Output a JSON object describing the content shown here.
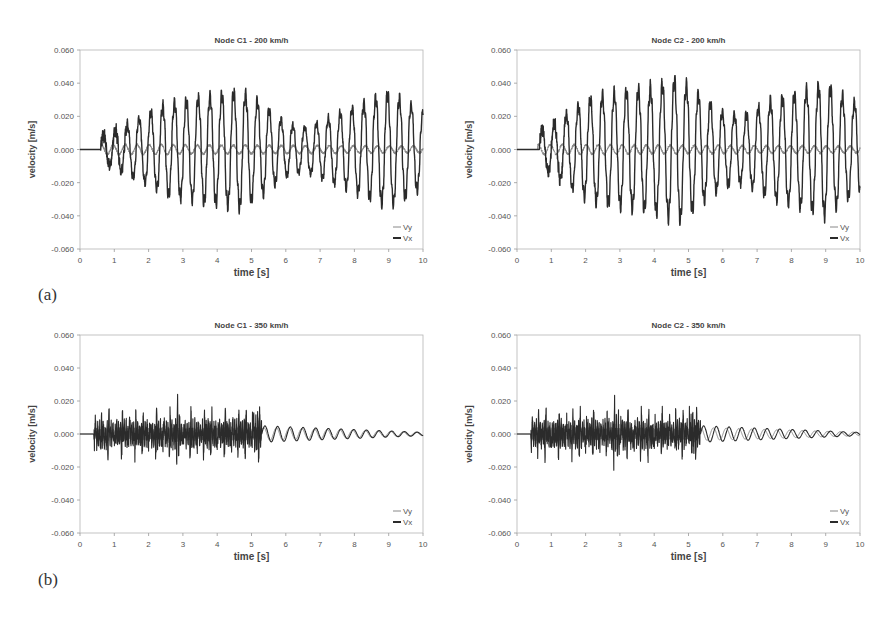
{
  "figure": {
    "panel_labels": [
      {
        "id": "a",
        "text": "(a)",
        "x": 38,
        "y": 285
      },
      {
        "id": "b",
        "text": "(b)",
        "x": 38,
        "y": 570
      }
    ]
  },
  "chart_data": [
    {
      "id": "c1-200",
      "type": "line",
      "title": "Node C1 - 200 km/h",
      "xlabel": "time [s]",
      "ylabel": "velocity [m/s]",
      "xlim": [
        0,
        10
      ],
      "ylim": [
        -0.06,
        0.06
      ],
      "xticks": [
        0,
        1,
        2,
        3,
        4,
        5,
        6,
        7,
        8,
        9,
        10
      ],
      "yticks": [
        "0.060",
        "0.040",
        "0.020",
        "0.000",
        "-0.020",
        "-0.040",
        "-0.060"
      ],
      "grid": false,
      "legend": {
        "position": "lower right",
        "entries": [
          "Vy",
          "Vx"
        ]
      },
      "plot_box": {
        "left": 80,
        "top": 50,
        "right": 423,
        "bottom": 249
      },
      "series": [
        {
          "name": "Vy",
          "color": "#888888",
          "width": 1.0,
          "description": "small oscillation about zero after ~0.6 s",
          "onset": 0.6,
          "period": 0.35,
          "amp_points": [
            [
              0.6,
              0.003
            ],
            [
              10,
              0.002
            ]
          ]
        },
        {
          "name": "Vx",
          "color": "#2b2b2b",
          "width": 1.4,
          "description": "large periodic oscillation, ~0.35 s period, envelope peaks near 4.7 s and 9.0 s",
          "onset": 0.6,
          "period": 0.345,
          "amp_points": [
            [
              0.6,
              0.008
            ],
            [
              1.0,
              0.011
            ],
            [
              1.7,
              0.018
            ],
            [
              2.5,
              0.027
            ],
            [
              3.5,
              0.031
            ],
            [
              4.7,
              0.035
            ],
            [
              5.3,
              0.027
            ],
            [
              6.0,
              0.016
            ],
            [
              6.5,
              0.013
            ],
            [
              7.3,
              0.019
            ],
            [
              8.3,
              0.028
            ],
            [
              9.0,
              0.034
            ],
            [
              9.7,
              0.026
            ],
            [
              10,
              0.022
            ]
          ],
          "peaks_pos_max": 0.034,
          "peaks_neg_min": -0.038
        }
      ]
    },
    {
      "id": "c2-200",
      "type": "line",
      "title": "Node C2 - 200 km/h",
      "xlabel": "time [s]",
      "ylabel": "velocity [m/s]",
      "xlim": [
        0,
        10
      ],
      "ylim": [
        -0.06,
        0.06
      ],
      "xticks": [
        0,
        1,
        2,
        3,
        4,
        5,
        6,
        7,
        8,
        9,
        10
      ],
      "yticks": [
        "0.060",
        "0.040",
        "0.020",
        "0.000",
        "-0.020",
        "-0.040",
        "-0.060"
      ],
      "grid": false,
      "legend": {
        "position": "lower right",
        "entries": [
          "Vy",
          "Vx"
        ]
      },
      "plot_box": {
        "left": 517,
        "top": 50,
        "right": 860,
        "bottom": 249
      },
      "series": [
        {
          "name": "Vy",
          "color": "#888888",
          "width": 1.0,
          "description": "small oscillation about zero after ~0.6 s",
          "onset": 0.6,
          "period": 0.35,
          "amp_points": [
            [
              0.6,
              0.003
            ],
            [
              10,
              0.002
            ]
          ]
        },
        {
          "name": "Vx",
          "color": "#2b2b2b",
          "width": 1.4,
          "description": "large periodic oscillation with spiky peaks, envelope max near 4.7 s (~0.042 / -0.045)",
          "onset": 0.65,
          "period": 0.35,
          "amp_points": [
            [
              0.65,
              0.012
            ],
            [
              1.0,
              0.014
            ],
            [
              1.5,
              0.022
            ],
            [
              2.2,
              0.031
            ],
            [
              3.0,
              0.034
            ],
            [
              4.0,
              0.037
            ],
            [
              4.7,
              0.042
            ],
            [
              5.3,
              0.033
            ],
            [
              6.0,
              0.022
            ],
            [
              6.6,
              0.02
            ],
            [
              7.4,
              0.029
            ],
            [
              8.4,
              0.035
            ],
            [
              9.0,
              0.039
            ],
            [
              9.7,
              0.029
            ],
            [
              10,
              0.027
            ]
          ],
          "peaks_pos_max": 0.042,
          "peaks_neg_min": -0.045
        }
      ]
    },
    {
      "id": "c1-350",
      "type": "line",
      "title": "Node C1 - 350 km/h",
      "xlabel": "time [s]",
      "ylabel": "velocity [m/s]",
      "xlim": [
        0,
        10
      ],
      "ylim": [
        -0.06,
        0.06
      ],
      "xticks": [
        0,
        1,
        2,
        3,
        4,
        5,
        6,
        7,
        8,
        9,
        10
      ],
      "yticks": [
        "0.060",
        "0.040",
        "0.020",
        "0.000",
        "-0.020",
        "-0.040",
        "-0.060"
      ],
      "grid": false,
      "legend": {
        "position": "lower right",
        "entries": [
          "Vy",
          "Vx"
        ]
      },
      "plot_box": {
        "left": 80,
        "top": 335,
        "right": 423,
        "bottom": 533
      },
      "series": [
        {
          "name": "Vy",
          "color": "#888888",
          "width": 1.0,
          "description": "low amplitude noise during passage 0.4-5.3 s, then near zero",
          "onset": 0.4,
          "end_burst": 5.3,
          "amp_points": [
            [
              0.4,
              0.004
            ],
            [
              5.3,
              0.004
            ],
            [
              10,
              0.001
            ]
          ]
        },
        {
          "name": "Vx",
          "color": "#2b2b2b",
          "width": 1.1,
          "description": "dense high-frequency burst 0.4-5.3 s (~±0.012, spikes to 0.015/-0.018), followed by decaying free vibration ~0.37 s period",
          "onset": 0.4,
          "end_burst": 5.3,
          "burst_amp": 0.011,
          "burst_spike_period": 0.2,
          "decay_period": 0.37,
          "decay_amp_start": 0.005,
          "decay_amp_end": 0.001,
          "peaks_pos_max": 0.015,
          "peaks_neg_min": -0.018
        }
      ]
    },
    {
      "id": "c2-350",
      "type": "line",
      "title": "Node C2 - 350 km/h",
      "xlabel": "time [s]",
      "ylabel": "velocity [m/s]",
      "xlim": [
        0,
        10
      ],
      "ylim": [
        -0.06,
        0.06
      ],
      "xticks": [
        0,
        1,
        2,
        3,
        4,
        5,
        6,
        7,
        8,
        9,
        10
      ],
      "yticks": [
        "0.060",
        "0.040",
        "0.020",
        "0.000",
        "-0.020",
        "-0.040",
        "-0.060"
      ],
      "grid": false,
      "legend": {
        "position": "lower right",
        "entries": [
          "Vy",
          "Vx"
        ]
      },
      "plot_box": {
        "left": 517,
        "top": 335,
        "right": 860,
        "bottom": 533
      },
      "series": [
        {
          "name": "Vy",
          "color": "#888888",
          "width": 1.0,
          "description": "low amplitude noise during passage 0.4-5.3 s, then near zero",
          "onset": 0.4,
          "end_burst": 5.3,
          "amp_points": [
            [
              0.4,
              0.004
            ],
            [
              5.3,
              0.004
            ],
            [
              10,
              0.001
            ]
          ]
        },
        {
          "name": "Vx",
          "color": "#2b2b2b",
          "width": 1.1,
          "description": "dense high-frequency burst 0.4-5.3 s (~±0.012, spikes to 0.020/-0.020), followed by decaying free vibration ~0.37 s period",
          "onset": 0.4,
          "end_burst": 5.35,
          "burst_amp": 0.011,
          "burst_spike_period": 0.2,
          "decay_period": 0.37,
          "decay_amp_start": 0.005,
          "decay_amp_end": 0.001,
          "peaks_pos_max": 0.021,
          "peaks_neg_min": -0.02
        }
      ]
    }
  ]
}
